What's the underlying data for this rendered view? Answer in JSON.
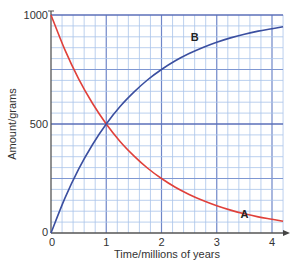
{
  "chart_data": {
    "type": "line",
    "title": "",
    "xlabel": "Time/millions of years",
    "ylabel": "Amount/grams",
    "xlim": [
      0,
      4.2
    ],
    "ylim": [
      0,
      1000
    ],
    "x_ticks": [
      0,
      1,
      2,
      3,
      4
    ],
    "x_tick_labels": [
      "0",
      "1",
      "2",
      "3",
      "4"
    ],
    "y_ticks": [
      0,
      500,
      1000
    ],
    "y_tick_labels": [
      "0",
      "500",
      "1000"
    ],
    "grid": true,
    "grid_minor_x": 0.2,
    "grid_minor_y": 50,
    "grid_major_y": 250,
    "series": [
      {
        "name": "A",
        "color": "#e0403a",
        "x": [
          0,
          0.25,
          0.5,
          0.75,
          1,
          1.25,
          1.5,
          1.75,
          2,
          2.25,
          2.5,
          2.75,
          3,
          3.25,
          3.5,
          3.75,
          4,
          4.2
        ],
        "values": [
          1000,
          841,
          707,
          595,
          500,
          420,
          354,
          297,
          250,
          210,
          177,
          149,
          125,
          105,
          88,
          74,
          63,
          54
        ],
        "label_at": [
          3.5,
          88
        ]
      },
      {
        "name": "B",
        "color": "#3b4fa0",
        "x": [
          0,
          0.25,
          0.5,
          0.75,
          1,
          1.25,
          1.5,
          1.75,
          2,
          2.25,
          2.5,
          2.75,
          3,
          3.25,
          3.5,
          3.75,
          4,
          4.2
        ],
        "values": [
          0,
          159,
          293,
          405,
          500,
          580,
          646,
          703,
          750,
          790,
          823,
          851,
          875,
          895,
          912,
          926,
          937,
          946
        ],
        "label_at": [
          2.6,
          900
        ]
      }
    ]
  }
}
